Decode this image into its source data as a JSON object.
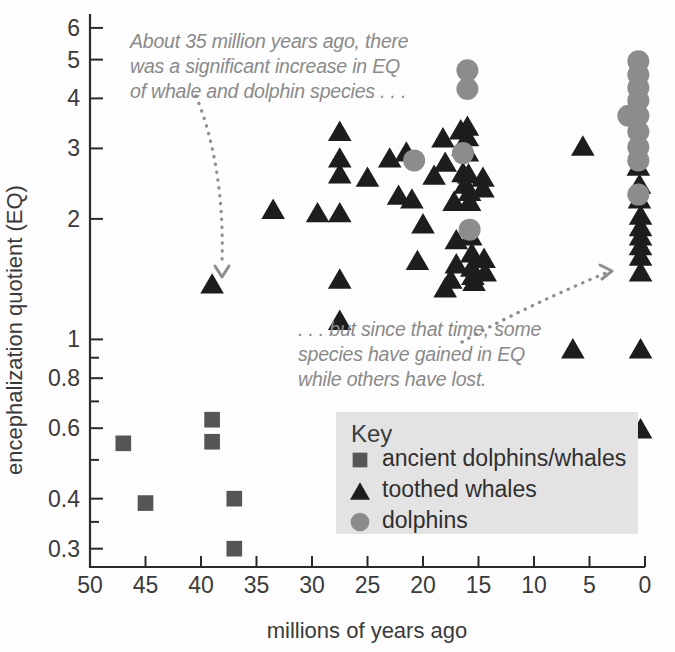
{
  "chart_data": {
    "type": "scatter",
    "title": "",
    "xlabel": "millions of years ago",
    "ylabel": "encephalization quotient (EQ)",
    "x_ticks": [
      50,
      45,
      40,
      35,
      30,
      25,
      20,
      15,
      10,
      5,
      0
    ],
    "x_tick_labels": [
      "50",
      "45",
      "40",
      "35",
      "30",
      "25",
      "20",
      "15",
      "10",
      "5",
      "0"
    ],
    "xlim": [
      50,
      0
    ],
    "x_axis_reversed": true,
    "y_scale": "log",
    "ylim": [
      0.27,
      6.5
    ],
    "y_ticks": [
      6,
      5,
      4,
      3,
      2,
      1,
      0.8,
      0.6,
      0.4,
      0.3
    ],
    "y_tick_labels": [
      "6",
      "5",
      "4",
      "3",
      "2",
      "1",
      "0.8",
      "0.6",
      "0.4",
      "0.3"
    ],
    "y_minor_ticks": [
      0.9,
      0.7,
      0.5,
      0.35
    ],
    "grid": false,
    "legend_position": "inside-lower-right",
    "series": [
      {
        "name": "ancient dolphins/whales",
        "marker": "square",
        "color": "#555555",
        "points": [
          {
            "x": 47.0,
            "y": 0.55
          },
          {
            "x": 45.0,
            "y": 0.39
          },
          {
            "x": 39.0,
            "y": 0.63
          },
          {
            "x": 39.0,
            "y": 0.555
          },
          {
            "x": 37.0,
            "y": 0.4
          },
          {
            "x": 37.0,
            "y": 0.3
          }
        ]
      },
      {
        "name": "toothed whales",
        "marker": "triangle",
        "color": "#1d1d1d",
        "points": [
          {
            "x": 39.0,
            "y": 1.38
          },
          {
            "x": 33.5,
            "y": 2.12
          },
          {
            "x": 27.5,
            "y": 3.32
          },
          {
            "x": 27.5,
            "y": 2.85
          },
          {
            "x": 27.5,
            "y": 2.6
          },
          {
            "x": 27.5,
            "y": 2.08
          },
          {
            "x": 27.5,
            "y": 1.42
          },
          {
            "x": 27.5,
            "y": 1.12
          },
          {
            "x": 29.5,
            "y": 2.08
          },
          {
            "x": 25.0,
            "y": 2.55
          },
          {
            "x": 23.0,
            "y": 2.85
          },
          {
            "x": 22.2,
            "y": 2.3
          },
          {
            "x": 21.0,
            "y": 2.25
          },
          {
            "x": 20.0,
            "y": 1.95
          },
          {
            "x": 19.0,
            "y": 2.58
          },
          {
            "x": 18.2,
            "y": 3.2
          },
          {
            "x": 18.0,
            "y": 2.78
          },
          {
            "x": 17.2,
            "y": 2.22
          },
          {
            "x": 17.0,
            "y": 1.78
          },
          {
            "x": 17.0,
            "y": 1.55
          },
          {
            "x": 16.6,
            "y": 3.35
          },
          {
            "x": 16.4,
            "y": 3.05
          },
          {
            "x": 16.4,
            "y": 2.62
          },
          {
            "x": 16.2,
            "y": 2.45
          },
          {
            "x": 16.0,
            "y": 3.42
          },
          {
            "x": 16.0,
            "y": 3.22
          },
          {
            "x": 16.0,
            "y": 2.95
          },
          {
            "x": 15.9,
            "y": 2.6
          },
          {
            "x": 15.8,
            "y": 2.35
          },
          {
            "x": 15.8,
            "y": 2.22
          },
          {
            "x": 15.7,
            "y": 1.82
          },
          {
            "x": 15.6,
            "y": 1.65
          },
          {
            "x": 15.6,
            "y": 1.52
          },
          {
            "x": 15.5,
            "y": 1.45
          },
          {
            "x": 15.4,
            "y": 1.4
          },
          {
            "x": 14.6,
            "y": 2.55
          },
          {
            "x": 14.6,
            "y": 2.4
          },
          {
            "x": 14.5,
            "y": 1.6
          },
          {
            "x": 14.4,
            "y": 1.48
          },
          {
            "x": 17.5,
            "y": 1.42
          },
          {
            "x": 18.0,
            "y": 1.35
          },
          {
            "x": 20.5,
            "y": 1.58
          },
          {
            "x": 21.5,
            "y": 2.95
          },
          {
            "x": 5.6,
            "y": 3.05
          },
          {
            "x": 6.5,
            "y": 0.95
          },
          {
            "x": 0.6,
            "y": 2.72
          },
          {
            "x": 0.5,
            "y": 2.45
          },
          {
            "x": 0.5,
            "y": 2.25
          },
          {
            "x": 0.4,
            "y": 2.05
          },
          {
            "x": 0.4,
            "y": 1.92
          },
          {
            "x": 0.4,
            "y": 1.82
          },
          {
            "x": 0.4,
            "y": 1.72
          },
          {
            "x": 0.4,
            "y": 1.62
          },
          {
            "x": 0.4,
            "y": 1.48
          },
          {
            "x": 0.4,
            "y": 0.95
          },
          {
            "x": 0.4,
            "y": 0.6
          }
        ]
      },
      {
        "name": "dolphins",
        "marker": "circle",
        "color": "#8c8c8c",
        "points": [
          {
            "x": 20.8,
            "y": 2.8
          },
          {
            "x": 16.0,
            "y": 4.7
          },
          {
            "x": 16.0,
            "y": 4.22
          },
          {
            "x": 16.4,
            "y": 2.92
          },
          {
            "x": 15.8,
            "y": 1.88
          },
          {
            "x": 0.6,
            "y": 4.95
          },
          {
            "x": 0.6,
            "y": 4.58
          },
          {
            "x": 0.6,
            "y": 4.25
          },
          {
            "x": 0.6,
            "y": 3.95
          },
          {
            "x": 1.5,
            "y": 3.62
          },
          {
            "x": 0.6,
            "y": 3.62
          },
          {
            "x": 0.6,
            "y": 3.3
          },
          {
            "x": 0.6,
            "y": 3.02
          },
          {
            "x": 0.6,
            "y": 2.8
          },
          {
            "x": 0.6,
            "y": 2.3
          }
        ]
      }
    ],
    "annotations": [
      {
        "id": "annotation-increase",
        "lines": [
          "About 35 million years ago, there",
          "was a significant increase in EQ",
          "of whale and dolphin species . . ."
        ],
        "points_to": {
          "x": 39.0,
          "y": 1.5
        }
      },
      {
        "id": "annotation-divergence",
        "lines": [
          ". . . but since that time, some",
          "species have gained in EQ",
          "while others have lost."
        ],
        "points_to": {
          "x": 1.2,
          "y": 2.75
        }
      }
    ]
  },
  "legend": {
    "title": "Key",
    "entries": [
      {
        "label": "ancient dolphins/whales",
        "marker": "square",
        "color": "#555555"
      },
      {
        "label": "toothed whales",
        "marker": "triangle",
        "color": "#1d1d1d"
      },
      {
        "label": "dolphins",
        "marker": "circle",
        "color": "#8c8c8c"
      }
    ],
    "background_color": "#e3e3e3"
  }
}
